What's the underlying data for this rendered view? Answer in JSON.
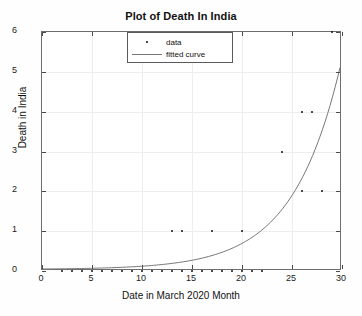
{
  "chart_data": {
    "type": "scatter",
    "title": "Plot of Death In India",
    "xlabel": "Date in March 2020 Month",
    "ylabel": "Death in India",
    "xlim": [
      0,
      30
    ],
    "ylim": [
      0,
      6
    ],
    "xticks": [
      0,
      5,
      10,
      15,
      20,
      25,
      30
    ],
    "yticks": [
      0,
      1,
      2,
      3,
      4,
      5,
      6
    ],
    "grid": true,
    "legend_position": "top-center",
    "series": [
      {
        "name": "data",
        "type": "scatter",
        "marker": "dot",
        "color": "#111111",
        "x": [
          2,
          3,
          4,
          5,
          6,
          7,
          8,
          9,
          10,
          11,
          12,
          13,
          14,
          15,
          16,
          17,
          18,
          19,
          20,
          21,
          22,
          13,
          14,
          17,
          20,
          26,
          28,
          24,
          26,
          27,
          29
        ],
        "y": [
          0,
          0,
          0,
          0,
          0,
          0,
          0,
          0,
          0,
          0,
          0,
          0,
          0,
          0,
          0,
          0,
          0,
          0,
          0,
          0,
          0,
          1,
          1,
          1,
          1,
          2,
          2,
          3,
          4,
          4,
          6
        ]
      },
      {
        "name": "fitted curve",
        "type": "line",
        "color": "#777777",
        "x": [
          0,
          2,
          4,
          6,
          8,
          10,
          12,
          14,
          16,
          18,
          20,
          22,
          24,
          26,
          28,
          30
        ],
        "y": [
          0.01,
          0.02,
          0.03,
          0.05,
          0.08,
          0.13,
          0.21,
          0.33,
          0.52,
          0.82,
          1.12,
          1.6,
          2.3,
          3.2,
          4.1,
          5.1
        ]
      }
    ]
  },
  "title": "Plot of Death In India",
  "axes": {
    "xlabel": "Date in March 2020 Month",
    "ylabel": "Death in India",
    "xticklabels": [
      "0",
      "5",
      "10",
      "15",
      "20",
      "25",
      "30"
    ],
    "yticklabels": [
      "0",
      "1",
      "2",
      "3",
      "4",
      "5",
      "6"
    ]
  },
  "legend": {
    "entries": [
      {
        "label": "data",
        "key": "marker-dot"
      },
      {
        "label": "fitted curve",
        "key": "line-solid"
      }
    ]
  }
}
